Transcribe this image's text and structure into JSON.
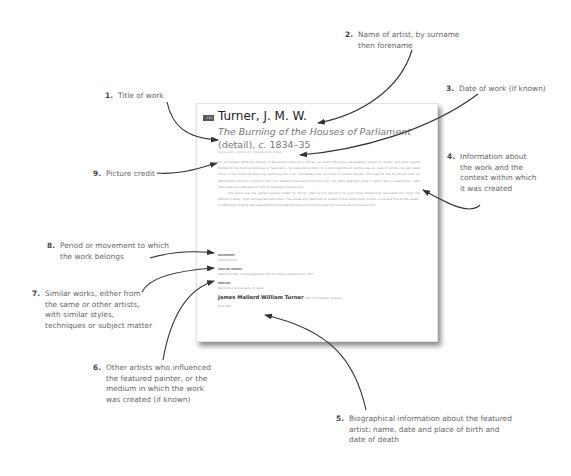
{
  "diagram": {
    "callouts": [
      {
        "number": "1.",
        "text": [
          "Title of work"
        ]
      },
      {
        "number": "2.",
        "text": [
          "Name of artist, by surname",
          "then forename"
        ]
      },
      {
        "number": "3.",
        "text": [
          "Date of work (if known)"
        ]
      },
      {
        "number": "4.",
        "text": [
          "Information about",
          "the work and the",
          "context within which",
          "it was created"
        ]
      },
      {
        "number": "5.",
        "text": [
          "Biographical information about the featured",
          "artist: name, date and place of birth and",
          "date of death"
        ]
      },
      {
        "number": "6.",
        "text": [
          "Other artists who influenced",
          "the featured painter, or the",
          "medium in which the work",
          "was created (if known)"
        ]
      },
      {
        "number": "7.",
        "text": [
          "Similar works, either from",
          "the same or other artists,",
          "with similar styles,",
          "techniques or subject matter"
        ]
      },
      {
        "number": "8.",
        "text": [
          "Period or movement to which",
          "the work belongs"
        ]
      },
      {
        "number": "9.",
        "text": [
          "Picture credit"
        ]
      }
    ]
  },
  "page": {
    "page_number": "182",
    "artist": "Turner, J. M. W.",
    "title": "The Burning of the Houses of Parliament",
    "title_suffix": "(detail),",
    "date_prefix": "c.",
    "date": "1834–35",
    "credit": "Clore Gallery, London, UK / Bridgeman Art Library",
    "body": [
      "On 16 October 1834 the Houses of Parliament went up in flames, an event that had a devastating impact on Turner, and other people flocked to the burning buildings in fascination, he was among them. It is not insignificant, as this was an area of London he had spent much of his childhood exploring, sketching the river. Thousands from his home in Covent Garden. The night of the fire Turner took his sketchbook and from a boat on the river sketched the scene from the river, his hasty sketches, done in pencil and in watercolour, were later used as a reference for two oil paintings of the scene.",
      "The scene was the perfect subject matter for Turner, offering him the form to paint those things that fascinated him most: the effects of water, light, atmosphere and colour. The smoke and heat that he evokes in this watercolour is both lyrical and true to the viewer, so effectively that he has captured the buildings precisely and finely through his careful use of line and form."
    ],
    "meta": [
      {
        "heading": "MOVEMENT",
        "value": "English School"
      },
      {
        "heading": "SIMILAR WORKS",
        "value": "Waterloo Bridge, Looking Upstream from the Thames Embankment, 1877"
      },
      {
        "heading": "MEDIUM",
        "value": "Watercolour and gouache on paper"
      }
    ],
    "bio_name": "James Mallord William Turner",
    "bio_birth": "Born 1775 London, England",
    "died": "Died 1851"
  }
}
